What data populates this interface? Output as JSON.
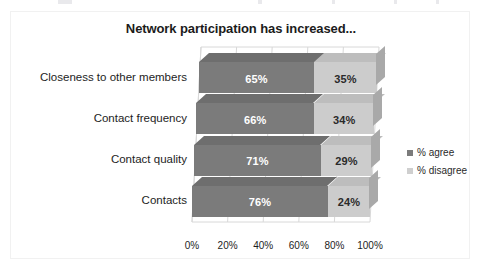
{
  "chart_data": {
    "type": "bar",
    "orientation": "horizontal",
    "stacked": true,
    "style": "3d",
    "title": "Network participation has increased...",
    "xlabel": "",
    "ylabel": "",
    "categories": [
      "Closeness to other members",
      "Contact frequency",
      "Contact quality",
      "Contacts"
    ],
    "series": [
      {
        "name": "% agree",
        "values": [
          65,
          66,
          71,
          76
        ],
        "color": "#7b7b7b"
      },
      {
        "name": "% disagree",
        "values": [
          35,
          34,
          29,
          24
        ],
        "color": "#cccccc"
      }
    ],
    "data_labels": [
      [
        "65%",
        "35%"
      ],
      [
        "66%",
        "34%"
      ],
      [
        "71%",
        "29%"
      ],
      [
        "76%",
        "24%"
      ]
    ],
    "xticks": [
      "0%",
      "20%",
      "40%",
      "60%",
      "80%",
      "100%"
    ],
    "xtick_values": [
      0,
      20,
      40,
      60,
      80,
      100
    ],
    "xlim": [
      0,
      100
    ],
    "grid": true,
    "legend_position": "right"
  },
  "legend": {
    "items": [
      {
        "label": "% agree",
        "color": "#7b7b7b"
      },
      {
        "label": "% disagree",
        "color": "#cfcfcf"
      }
    ]
  },
  "colors": {
    "agree": "#7b7b7b",
    "agree_top": "#6e6e6e",
    "agree_side": "#5f5f5f",
    "disagree": "#cccccc",
    "disagree_top": "#bdbdbd",
    "disagree_side": "#a9a9a9",
    "grid": "#d8d8d8",
    "text": "#1d1d1d",
    "frame": "#f1f1f1"
  }
}
